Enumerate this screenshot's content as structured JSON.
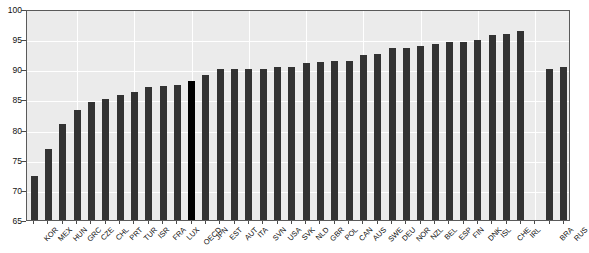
{
  "chart_data": {
    "type": "bar",
    "title": "",
    "subtitle": "",
    "xlabel": "",
    "ylabel": "",
    "ylim": [
      65,
      100
    ],
    "ytick_values": [
      65,
      70,
      75,
      80,
      85,
      90,
      95,
      100
    ],
    "ytick_labels": [
      "65",
      "70",
      "75",
      "80",
      "85",
      "90",
      "95",
      "100"
    ],
    "grid": true,
    "legend": "none",
    "highlight_category": "OECD",
    "group_gap_after": "IRL",
    "colors": {
      "bar": "#333333",
      "bar_highlight": "#000000",
      "plot_background": "#ebebeb",
      "gridline": "#ffffff",
      "frame": "#5a5a5a",
      "text": "#111111"
    },
    "categories": [
      "KOR",
      "MEX",
      "HUN",
      "GRC",
      "CZE",
      "CHL",
      "PRT",
      "TUR",
      "ISR",
      "FRA",
      "LUX",
      "OECD",
      "JPN",
      "EST",
      "AUT",
      "ITA",
      "SVN",
      "USA",
      "SVK",
      "NLD",
      "GBR",
      "POL",
      "CAN",
      "AUS",
      "SWE",
      "DEU",
      "NOR",
      "NZL",
      "BEL",
      "ESP",
      "FIN",
      "DNK",
      "ISL",
      "CHE",
      "IRL",
      "",
      "BRA",
      "RUS"
    ],
    "values": [
      72.3,
      76.7,
      81.0,
      83.2,
      84.5,
      85.0,
      85.7,
      86.2,
      87.0,
      87.3,
      87.4,
      88.0,
      89.0,
      90.0,
      90.0,
      90.1,
      90.0,
      90.4,
      90.4,
      91.0,
      91.2,
      91.3,
      91.4,
      92.4,
      92.6,
      93.6,
      93.6,
      93.8,
      94.2,
      94.5,
      94.6,
      94.9,
      95.7,
      95.8,
      96.3,
      null,
      90.0,
      90.4
    ]
  }
}
